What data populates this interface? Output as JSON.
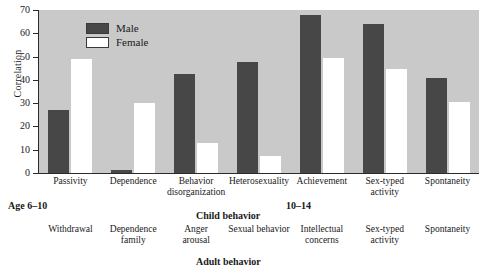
{
  "chart_data": {
    "type": "bar",
    "title": "",
    "xlabel": "Child behavior",
    "ylabel": "Correlation",
    "ylim": [
      0,
      70
    ],
    "yticks": [
      0,
      10,
      20,
      30,
      40,
      50,
      60,
      70
    ],
    "grid": false,
    "legend_position": "top-left",
    "categories": [
      "Passivity",
      "Dependence",
      "Behavior disorganization",
      "Heterosexuality",
      "Achievement",
      "Sex-typed activity",
      "Spontaneity"
    ],
    "series": [
      {
        "name": "Male",
        "values": [
          27,
          1.5,
          42.5,
          47.5,
          68,
          64,
          41
        ]
      },
      {
        "name": "Female",
        "values": [
          49,
          30,
          13,
          7.5,
          49.5,
          44.5,
          30.5
        ]
      }
    ],
    "secondary_categories": [
      "Withdrawal",
      "Dependence family",
      "Anger arousal",
      "Sexual behavior",
      "Intellectual concerns",
      "Sex-typed activity",
      "Spontaneity"
    ],
    "secondary_xlabel": "Adult behavior",
    "annotations": [
      {
        "text": "Age 6–10",
        "position": "below-axis-left"
      },
      {
        "text": "10–14",
        "position": "below-axis-right"
      }
    ],
    "colors": {
      "male": "#474747",
      "female": "#ffffff",
      "plot_background": "#c9c9c9",
      "axis": "#2b2b2b"
    }
  },
  "axis": {
    "y_title": "Correlation",
    "y_ticks": [
      "70",
      "60",
      "50",
      "40",
      "30",
      "20",
      "10",
      "0"
    ]
  },
  "legend": {
    "items": [
      {
        "label": "Male",
        "swatch": "male"
      },
      {
        "label": "Female",
        "swatch": "female"
      }
    ]
  },
  "child_labels": [
    {
      "line1": "Passivity",
      "line2": ""
    },
    {
      "line1": "Dependence",
      "line2": ""
    },
    {
      "line1": "Behavior",
      "line2": "disorganization"
    },
    {
      "line1": "Heterosexuality",
      "line2": ""
    },
    {
      "line1": "Achievement",
      "line2": ""
    },
    {
      "line1": "Sex-typed",
      "line2": "activity"
    },
    {
      "line1": "Spontaneity",
      "line2": ""
    }
  ],
  "adult_labels": [
    {
      "line1": "Withdrawal",
      "line2": ""
    },
    {
      "line1": "Dependence",
      "line2": "family"
    },
    {
      "line1": "Anger",
      "line2": "arousal"
    },
    {
      "line1": "Sexual behavior",
      "line2": ""
    },
    {
      "line1": "Intellectual",
      "line2": "concerns"
    },
    {
      "line1": "Sex-typed",
      "line2": "activity"
    },
    {
      "line1": "Spontaneity",
      "line2": ""
    }
  ],
  "captions": {
    "age_left": "Age 6–10",
    "age_right": "10–14",
    "child_behavior": "Child behavior",
    "adult_behavior": "Adult behavior"
  }
}
